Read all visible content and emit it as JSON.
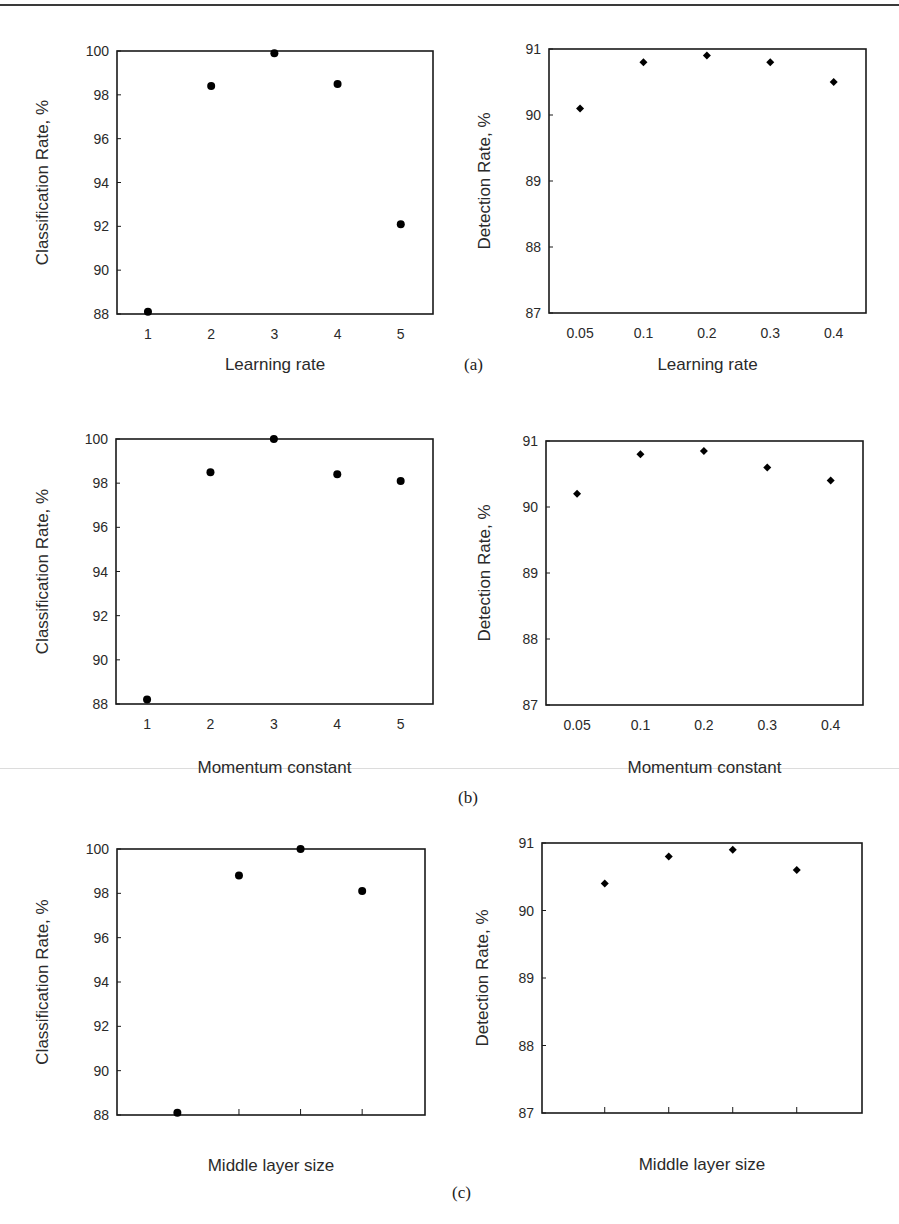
{
  "figure": {
    "panel_labels": [
      "(a)",
      "(b)",
      "(c)"
    ]
  },
  "chart_data": [
    {
      "id": "a-left",
      "panel": "(a)",
      "type": "scatter",
      "title": "",
      "xlabel": "Learning rate",
      "ylabel": "Classification Rate, %",
      "categories": [
        "1",
        "2",
        "3",
        "4",
        "5"
      ],
      "values": [
        88.1,
        98.4,
        99.9,
        98.5,
        92.1
      ],
      "ylim": [
        88,
        100
      ],
      "yticks": [
        88,
        90,
        92,
        94,
        96,
        98,
        100
      ],
      "marker": "circle",
      "grid": false
    },
    {
      "id": "a-right",
      "panel": "(a)",
      "type": "scatter",
      "title": "",
      "xlabel": "Learning rate",
      "ylabel": "Detection Rate, %",
      "categories": [
        "0.05",
        "0.1",
        "0.2",
        "0.3",
        "0.4"
      ],
      "values": [
        90.1,
        90.8,
        90.9,
        90.8,
        90.5
      ],
      "ylim": [
        87,
        91
      ],
      "yticks": [
        87,
        88,
        89,
        90,
        91
      ],
      "marker": "diamond",
      "grid": false
    },
    {
      "id": "b-left",
      "panel": "(b)",
      "type": "scatter",
      "title": "",
      "xlabel": "Momentum constant",
      "ylabel": "Classification Rate, %",
      "categories": [
        "1",
        "2",
        "3",
        "4",
        "5"
      ],
      "values": [
        88.2,
        98.5,
        100.0,
        98.4,
        98.1
      ],
      "ylim": [
        88,
        100
      ],
      "yticks": [
        88,
        90,
        92,
        94,
        96,
        98,
        100
      ],
      "marker": "circle",
      "grid": false
    },
    {
      "id": "b-right",
      "panel": "(b)",
      "type": "scatter",
      "title": "",
      "xlabel": "Momentum constant",
      "ylabel": "Detection Rate, %",
      "categories": [
        "0.05",
        "0.1",
        "0.2",
        "0.3",
        "0.4"
      ],
      "values": [
        90.2,
        90.8,
        90.85,
        90.6,
        90.4
      ],
      "ylim": [
        87,
        91
      ],
      "yticks": [
        87,
        88,
        89,
        90,
        91
      ],
      "marker": "diamond",
      "grid": false
    },
    {
      "id": "c-left",
      "panel": "(c)",
      "type": "scatter",
      "title": "",
      "xlabel": "Middle layer size",
      "ylabel": "Classification Rate, %",
      "categories": [
        "",
        "",
        "",
        ""
      ],
      "values": [
        88.1,
        98.8,
        100.0,
        98.1
      ],
      "ylim": [
        88,
        100
      ],
      "yticks": [
        88,
        90,
        92,
        94,
        96,
        98,
        100
      ],
      "marker": "circle",
      "grid": false
    },
    {
      "id": "c-right",
      "panel": "(c)",
      "type": "scatter",
      "title": "",
      "xlabel": "Middle layer size",
      "ylabel": "Detection Rate, %",
      "categories": [
        "",
        "",
        "",
        ""
      ],
      "values": [
        90.4,
        90.8,
        90.9,
        90.6
      ],
      "ylim": [
        87,
        91
      ],
      "yticks": [
        87,
        88,
        89,
        90,
        91
      ],
      "marker": "diamond",
      "grid": false
    }
  ]
}
